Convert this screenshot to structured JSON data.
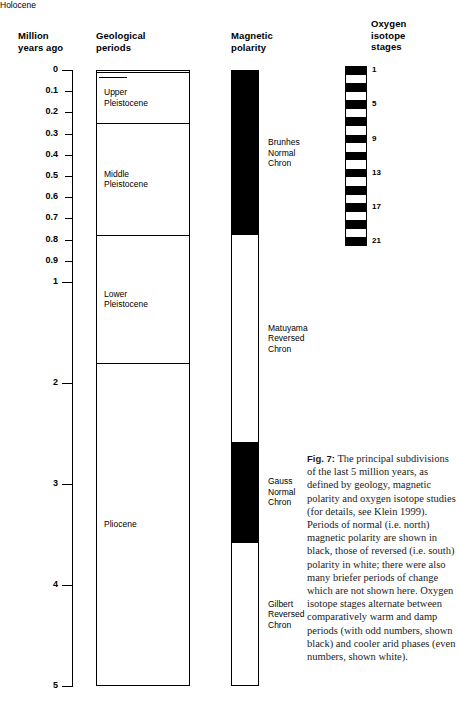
{
  "figure": {
    "number": "Fig. 7:",
    "top_crop_text": "",
    "caption": "The principal subdivisions of the last 5 million years, as defined by geology, magnetic polarity and oxygen isotope studies (for details, see Klein 1999). Periods of normal (i.e. north) magnetic polarity are shown in black, those of reversed (i.e. south) polarity in white; there were also many briefer periods of change which are not shown here. Oxygen isotope stages alternate between comparatively warm and damp periods (with odd numbers, shown black) and cooler arid phases (even numbers, shown white)."
  },
  "headers": {
    "age": "Million\nyears ago",
    "geological": "Geological\nperiods",
    "magnetic": "Magnetic\npolarity",
    "oxygen": "Oxygen\nisotope\nstages"
  },
  "chart_data": {
    "type": "table",
    "ylabel": "Million years ago",
    "ylim": [
      0,
      5
    ],
    "grid": false,
    "axis_ticks": [
      {
        "value": 0,
        "label": "0",
        "major": true
      },
      {
        "value": 0.1,
        "label": "0.1",
        "major": false
      },
      {
        "value": 0.2,
        "label": "0.2",
        "major": false
      },
      {
        "value": 0.3,
        "label": "0.3",
        "major": false
      },
      {
        "value": 0.4,
        "label": "0.4",
        "major": false
      },
      {
        "value": 0.5,
        "label": "0.5",
        "major": false
      },
      {
        "value": 0.6,
        "label": "0.6",
        "major": false
      },
      {
        "value": 0.7,
        "label": "0.7",
        "major": false
      },
      {
        "value": 0.8,
        "label": "0.8",
        "major": false
      },
      {
        "value": 0.9,
        "label": "0.9",
        "major": false
      },
      {
        "value": 1,
        "label": "1",
        "major": true
      },
      {
        "value": 2,
        "label": "2",
        "major": true
      },
      {
        "value": 3,
        "label": "3",
        "major": true
      },
      {
        "value": 4,
        "label": "4",
        "major": true
      },
      {
        "value": 5,
        "label": "5",
        "major": true
      }
    ],
    "geological_periods": [
      {
        "name": "Holocene",
        "start": 0.0,
        "end": 0.01,
        "callout": true
      },
      {
        "name": "Upper\nPleistocene",
        "start": 0.01,
        "end": 0.25,
        "callout": false
      },
      {
        "name": "Middle\nPleistocene",
        "start": 0.25,
        "end": 0.78,
        "callout": false
      },
      {
        "name": "Lower\nPleistocene",
        "start": 0.78,
        "end": 1.8,
        "callout": false
      },
      {
        "name": "Pliocene",
        "start": 1.8,
        "end": 5.0,
        "callout": false
      }
    ],
    "magnetic_chrons": [
      {
        "name": "Brunhes\nNormal\nChron",
        "start": 0.0,
        "end": 0.78,
        "polarity": "normal",
        "color": "#000000"
      },
      {
        "name": "Matuyama\nReversed\nChron",
        "start": 0.78,
        "end": 2.58,
        "polarity": "reversed",
        "color": "#ffffff"
      },
      {
        "name": "Gauss\nNormal\nChron",
        "start": 2.58,
        "end": 3.58,
        "polarity": "normal",
        "color": "#000000"
      },
      {
        "name": "Gilbert\nReversed\nChron",
        "start": 3.58,
        "end": 5.0,
        "polarity": "reversed",
        "color": "#ffffff"
      }
    ],
    "oxygen_isotope_stages": {
      "range_top": 0.0,
      "range_bottom": 0.95,
      "labels": [
        {
          "stage": "1",
          "at": 0.0
        },
        {
          "stage": "5",
          "at": 0.1
        },
        {
          "stage": "9",
          "at": 0.3
        },
        {
          "stage": "13",
          "at": 0.5
        },
        {
          "stage": "17",
          "at": 0.68
        },
        {
          "stage": "21",
          "at": 0.88
        }
      ],
      "bands": [
        {
          "stage": 1,
          "shade": "black"
        },
        {
          "stage": 2,
          "shade": "white"
        },
        {
          "stage": 3,
          "shade": "black"
        },
        {
          "stage": 4,
          "shade": "white"
        },
        {
          "stage": 5,
          "shade": "black"
        },
        {
          "stage": 6,
          "shade": "white"
        },
        {
          "stage": 7,
          "shade": "black"
        },
        {
          "stage": 8,
          "shade": "white"
        },
        {
          "stage": 9,
          "shade": "black"
        },
        {
          "stage": 10,
          "shade": "white"
        },
        {
          "stage": 11,
          "shade": "black"
        },
        {
          "stage": 12,
          "shade": "white"
        },
        {
          "stage": 13,
          "shade": "black"
        },
        {
          "stage": 14,
          "shade": "white"
        },
        {
          "stage": 15,
          "shade": "black"
        },
        {
          "stage": 16,
          "shade": "white"
        },
        {
          "stage": 17,
          "shade": "black"
        },
        {
          "stage": 18,
          "shade": "white"
        },
        {
          "stage": 19,
          "shade": "black"
        },
        {
          "stage": 20,
          "shade": "white"
        },
        {
          "stage": 21,
          "shade": "black"
        }
      ]
    }
  },
  "colors": {
    "ink": "#000000",
    "paper": "#ffffff",
    "caption_ink": "#1b1b1b"
  }
}
